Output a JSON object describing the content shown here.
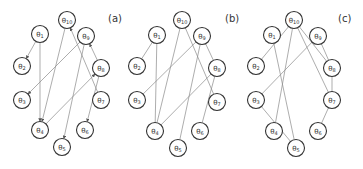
{
  "figure": {
    "node_radius": 8.5,
    "edge_color": "#8a8a8a",
    "node_stroke": "#333333",
    "panels": [
      {
        "id": "a",
        "label": "(a)",
        "label_pos": [
          108,
          22
        ],
        "directed": true,
        "nodes": [
          {
            "id": "10",
            "label": "θ10",
            "x": 67,
            "y": 20
          },
          {
            "id": "1",
            "label": "θ1",
            "x": 40,
            "y": 34
          },
          {
            "id": "9",
            "label": "θ9",
            "x": 86,
            "y": 36
          },
          {
            "id": "2",
            "label": "θ2",
            "x": 22,
            "y": 66
          },
          {
            "id": "8",
            "label": "θ8",
            "x": 101,
            "y": 68
          },
          {
            "id": "3",
            "label": "θ3",
            "x": 22,
            "y": 100
          },
          {
            "id": "7",
            "label": "θ7",
            "x": 101,
            "y": 100
          },
          {
            "id": "4",
            "label": "θ4",
            "x": 40,
            "y": 130
          },
          {
            "id": "6",
            "label": "θ6",
            "x": 85,
            "y": 130
          },
          {
            "id": "5",
            "label": "θ5",
            "x": 62,
            "y": 147
          }
        ],
        "edges": [
          {
            "from": "1",
            "to": "2"
          },
          {
            "from": "1",
            "to": "4"
          },
          {
            "from": "10",
            "to": "4"
          },
          {
            "from": "7",
            "to": "10"
          },
          {
            "from": "9",
            "to": "3"
          },
          {
            "from": "9",
            "to": "5"
          },
          {
            "from": "8",
            "to": "9"
          },
          {
            "from": "4",
            "to": "8"
          },
          {
            "from": "8",
            "to": "6"
          }
        ]
      },
      {
        "id": "b",
        "label": "(b)",
        "label_pos": [
          225,
          22
        ],
        "directed": false,
        "nodes": [
          {
            "id": "10",
            "label": "θ10",
            "x": 182,
            "y": 20
          },
          {
            "id": "1",
            "label": "θ1",
            "x": 157,
            "y": 35
          },
          {
            "id": "9",
            "label": "θ9",
            "x": 202,
            "y": 36
          },
          {
            "id": "2",
            "label": "θ2",
            "x": 137,
            "y": 66
          },
          {
            "id": "8",
            "label": "θ8",
            "x": 217,
            "y": 68
          },
          {
            "id": "3",
            "label": "θ3",
            "x": 137,
            "y": 100
          },
          {
            "id": "7",
            "label": "θ7",
            "x": 217,
            "y": 102
          },
          {
            "id": "4",
            "label": "θ4",
            "x": 155,
            "y": 131
          },
          {
            "id": "6",
            "label": "θ6",
            "x": 200,
            "y": 131
          },
          {
            "id": "5",
            "label": "θ5",
            "x": 178,
            "y": 148
          }
        ],
        "edges": [
          {
            "from": "1",
            "to": "2"
          },
          {
            "from": "1",
            "to": "4"
          },
          {
            "from": "10",
            "to": "4"
          },
          {
            "from": "10",
            "to": "7"
          },
          {
            "from": "9",
            "to": "3"
          },
          {
            "from": "9",
            "to": "5"
          },
          {
            "from": "9",
            "to": "8"
          },
          {
            "from": "8",
            "to": "4"
          },
          {
            "from": "8",
            "to": "6"
          }
        ]
      },
      {
        "id": "c",
        "label": "(c)",
        "label_pos": [
          338,
          22
        ],
        "directed": false,
        "nodes": [
          {
            "id": "10",
            "label": "θ10",
            "x": 294,
            "y": 20
          },
          {
            "id": "1",
            "label": "θ1",
            "x": 272,
            "y": 35
          },
          {
            "id": "9",
            "label": "θ9",
            "x": 318,
            "y": 36
          },
          {
            "id": "2",
            "label": "θ2",
            "x": 256,
            "y": 66
          },
          {
            "id": "8",
            "label": "θ8",
            "x": 332,
            "y": 68
          },
          {
            "id": "3",
            "label": "θ3",
            "x": 256,
            "y": 100
          },
          {
            "id": "7",
            "label": "θ7",
            "x": 332,
            "y": 100
          },
          {
            "id": "4",
            "label": "θ4",
            "x": 274,
            "y": 131
          },
          {
            "id": "6",
            "label": "θ6",
            "x": 318,
            "y": 131
          },
          {
            "id": "5",
            "label": "θ5",
            "x": 296,
            "y": 148
          }
        ],
        "edges": [
          {
            "from": "10",
            "to": "2"
          },
          {
            "from": "10",
            "to": "4"
          },
          {
            "from": "10",
            "to": "8"
          },
          {
            "from": "10",
            "to": "7"
          },
          {
            "from": "1",
            "to": "5"
          },
          {
            "from": "9",
            "to": "3"
          },
          {
            "from": "9",
            "to": "8"
          },
          {
            "from": "3",
            "to": "5"
          },
          {
            "from": "8",
            "to": "7"
          },
          {
            "from": "7",
            "to": "6"
          }
        ]
      }
    ]
  }
}
